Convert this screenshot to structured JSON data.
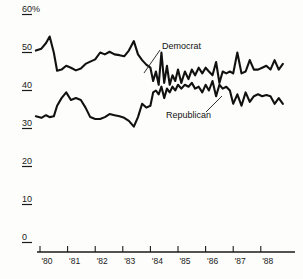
{
  "chart_data": {
    "type": "line",
    "title": "",
    "subtitle": "",
    "xlabel": "",
    "ylabel": "",
    "ylim": [
      0,
      60
    ],
    "xlim": [
      1979.75,
      1988.9
    ],
    "grid": false,
    "legend_position": "inline-annotations",
    "y_ticks": [
      {
        "value": 60,
        "label": "60%"
      },
      {
        "value": 50,
        "label": "50"
      },
      {
        "value": 40,
        "label": "40"
      },
      {
        "value": 30,
        "label": "30"
      },
      {
        "value": 20,
        "label": "20"
      },
      {
        "value": 10,
        "label": "10"
      },
      {
        "value": 0,
        "label": "0"
      }
    ],
    "x_ticks": [
      {
        "value": 1980,
        "label": "'80"
      },
      {
        "value": 1981,
        "label": "'81"
      },
      {
        "value": 1982,
        "label": "'82"
      },
      {
        "value": 1983,
        "label": "'83"
      },
      {
        "value": 1984,
        "label": "'84"
      },
      {
        "value": 1985,
        "label": "'85"
      },
      {
        "value": 1986,
        "label": "'86"
      },
      {
        "value": 1987,
        "label": "'87"
      },
      {
        "value": 1988,
        "label": "'88"
      }
    ],
    "annotations": [
      {
        "name": "democrat",
        "text": "Democrat",
        "text_x": 162,
        "text_y": 41,
        "leader_from": [
          160,
          50
        ],
        "leader_to": [
          144,
          73
        ]
      },
      {
        "name": "republican",
        "text": "Republican",
        "text_x": 166,
        "text_y": 110,
        "leader_from": [
          206,
          112
        ],
        "leader_to": [
          222,
          96
        ]
      }
    ],
    "series": [
      {
        "name": "Democrat",
        "color": "#111111",
        "x": [
          1979.85,
          1980.05,
          1980.22,
          1980.35,
          1980.5,
          1980.62,
          1980.78,
          1980.95,
          1981.12,
          1981.3,
          1981.48,
          1981.65,
          1981.82,
          1982.0,
          1982.18,
          1982.35,
          1982.52,
          1982.7,
          1982.88,
          1983.05,
          1983.22,
          1983.4,
          1983.55,
          1983.7,
          1983.85,
          1984.0,
          1984.1,
          1984.2,
          1984.3,
          1984.4,
          1984.5,
          1984.6,
          1984.7,
          1984.8,
          1984.9,
          1985.0,
          1985.12,
          1985.25,
          1985.38,
          1985.5,
          1985.62,
          1985.75,
          1985.88,
          1986.0,
          1986.12,
          1986.25,
          1986.38,
          1986.5,
          1986.62,
          1986.75,
          1986.88,
          1987.0,
          1987.15,
          1987.3,
          1987.45,
          1987.6,
          1987.75,
          1987.9,
          1988.05,
          1988.2,
          1988.35,
          1988.5,
          1988.65,
          1988.8
        ],
        "values": [
          50.5,
          51.0,
          52.5,
          54.2,
          50.0,
          45.2,
          45.5,
          46.5,
          46.0,
          45.3,
          45.8,
          47.0,
          47.6,
          48.2,
          50.0,
          49.5,
          50.2,
          49.5,
          49.3,
          49.0,
          50.5,
          53.0,
          49.5,
          48.0,
          46.8,
          46.0,
          42.5,
          45.0,
          41.5,
          50.0,
          42.0,
          46.5,
          41.5,
          44.0,
          42.5,
          45.5,
          42.0,
          45.0,
          43.0,
          45.5,
          44.0,
          46.0,
          44.5,
          46.0,
          45.0,
          44.0,
          47.5,
          42.0,
          45.0,
          44.5,
          45.0,
          44.5,
          50.0,
          44.5,
          45.0,
          48.0,
          45.5,
          45.5,
          46.0,
          46.5,
          45.5,
          48.0,
          45.5,
          47.0
        ]
      },
      {
        "name": "Republican",
        "color": "#111111",
        "x": [
          1979.85,
          1980.05,
          1980.22,
          1980.35,
          1980.5,
          1980.62,
          1980.78,
          1980.95,
          1981.12,
          1981.3,
          1981.48,
          1981.65,
          1981.82,
          1982.0,
          1982.18,
          1982.35,
          1982.52,
          1982.7,
          1982.88,
          1983.05,
          1983.22,
          1983.4,
          1983.55,
          1983.7,
          1983.85,
          1984.0,
          1984.1,
          1984.2,
          1984.3,
          1984.4,
          1984.5,
          1984.6,
          1984.7,
          1984.8,
          1984.9,
          1985.0,
          1985.12,
          1985.25,
          1985.38,
          1985.5,
          1985.62,
          1985.75,
          1985.88,
          1986.0,
          1986.12,
          1986.25,
          1986.38,
          1986.5,
          1986.62,
          1986.75,
          1986.88,
          1987.0,
          1987.15,
          1987.3,
          1987.45,
          1987.6,
          1987.75,
          1987.9,
          1988.05,
          1988.2,
          1988.35,
          1988.5,
          1988.65,
          1988.8
        ],
        "values": [
          33.2,
          32.8,
          33.5,
          33.0,
          33.2,
          36.0,
          38.0,
          39.5,
          37.5,
          38.0,
          37.5,
          35.5,
          33.0,
          32.5,
          32.5,
          33.0,
          33.8,
          33.5,
          33.2,
          32.8,
          32.0,
          30.5,
          33.0,
          36.5,
          35.5,
          36.0,
          39.5,
          40.0,
          39.0,
          41.0,
          38.0,
          40.5,
          39.5,
          41.0,
          40.0,
          41.5,
          40.5,
          41.5,
          41.0,
          42.0,
          40.5,
          41.0,
          39.5,
          41.5,
          40.0,
          42.5,
          38.5,
          41.5,
          40.5,
          41.0,
          40.0,
          36.5,
          39.0,
          36.0,
          39.5,
          37.0,
          38.5,
          39.0,
          38.5,
          38.8,
          38.5,
          36.5,
          38.0,
          36.5
        ]
      }
    ]
  },
  "axis": {
    "x_axis_color": "#1a1a1a",
    "tick_color": "#1a1a1a"
  }
}
